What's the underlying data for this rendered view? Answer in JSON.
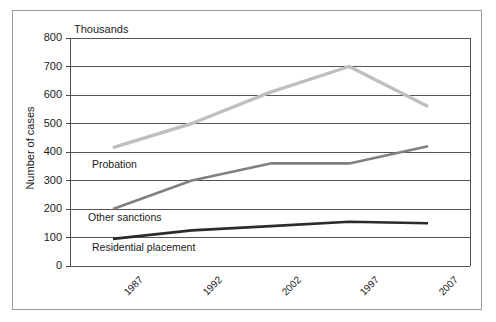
{
  "chart_data": {
    "type": "line",
    "title": "",
    "subtitle": "",
    "unit_label": "Thousands",
    "xlabel": "",
    "ylabel": "Number of cases",
    "categories": [
      "1987",
      "1992",
      "2002",
      "1997",
      "2007"
    ],
    "ylim": [
      0,
      800
    ],
    "ytick_step": 100,
    "yticks": [
      "800",
      "700",
      "600",
      "500",
      "400",
      "300",
      "200",
      "100",
      "0"
    ],
    "grid": "horizontal",
    "legend_position": "inline-annotations",
    "series": [
      {
        "name": "Probation",
        "color": "#bfbfbf",
        "line_width": 3.4,
        "values": [
          415,
          500,
          610,
          700,
          560
        ]
      },
      {
        "name": "Other sanctions",
        "color": "#808080",
        "line_width": 2.6,
        "values": [
          200,
          300,
          360,
          360,
          420
        ]
      },
      {
        "name": "Residential placement",
        "color": "#2b2b2b",
        "line_width": 2.6,
        "values": [
          95,
          125,
          140,
          155,
          150
        ]
      }
    ],
    "annotations": [
      {
        "text": "Probation",
        "x": 92,
        "y": 158
      },
      {
        "text": "Other sanctions",
        "x": 88,
        "y": 211
      },
      {
        "text": "Residential placement",
        "x": 92,
        "y": 241
      }
    ],
    "colors": {
      "frame": "#9a9a9a",
      "axis": "#4d4d4d",
      "gridline": "#555555",
      "text": "#1a1a1a",
      "background": "#ffffff"
    }
  }
}
